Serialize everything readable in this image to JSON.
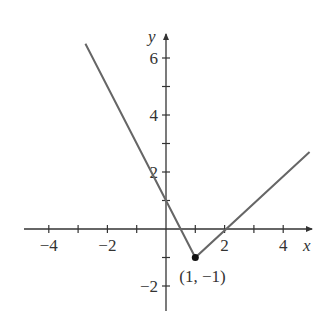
{
  "chart_data": {
    "type": "line",
    "title": "",
    "xlabel": "x",
    "ylabel": "y",
    "function": "y = |2x-2|... piecewise: y = -2x+1 for x<=1, y = x-2 for x>=1",
    "series": [
      {
        "name": "f(x)",
        "x": [
          -2.75,
          1,
          4.9
        ],
        "y": [
          6.5,
          -1,
          2.7
        ]
      }
    ],
    "points": [
      {
        "x": 1,
        "y": -1,
        "label": "(1, −1)"
      }
    ],
    "xlim": [
      -4.8,
      5
    ],
    "ylim": [
      -3,
      7
    ],
    "x_ticks": [
      -4,
      -3,
      -2,
      -1,
      1,
      2,
      3,
      4
    ],
    "x_tick_labels": [
      "−4",
      "−2",
      "2",
      "4"
    ],
    "x_tick_label_values": [
      -4,
      -2,
      2,
      4
    ],
    "y_ticks": [
      -2,
      -1,
      1,
      2,
      3,
      4,
      5,
      6
    ],
    "y_tick_labels": [
      "−2",
      "2",
      "4",
      "6"
    ],
    "y_tick_label_values": [
      -2,
      2,
      4,
      6
    ],
    "grid": false,
    "legend": null,
    "line_color": "#666666",
    "axis_color": "#333333"
  },
  "labels": {
    "x_axis": "x",
    "y_axis": "y",
    "vertex": "(1, −1)"
  }
}
